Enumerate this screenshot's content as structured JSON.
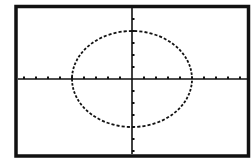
{
  "screen": {
    "type": "graphing-calculator-plot",
    "background": "#ffffff",
    "ink": "#111111"
  },
  "window": {
    "xmin": -9.6,
    "xmax": 9.6,
    "ymin": -6.4,
    "ymax": 6.2,
    "xscl": 1,
    "yscl": 1
  },
  "curve": {
    "kind": "ellipse",
    "equation": "x^2/25 + y^2/16 = 1",
    "center": [
      0,
      0
    ],
    "semi_axis_x": 5,
    "semi_axis_y": 4,
    "style": "dotted-pixel"
  }
}
